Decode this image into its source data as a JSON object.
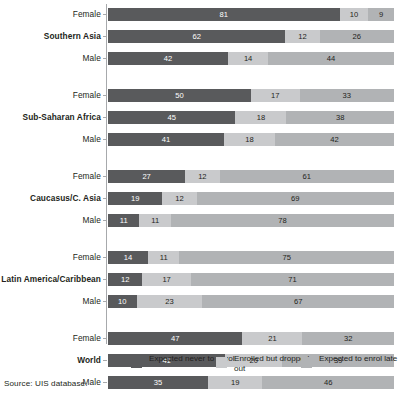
{
  "chart_data": {
    "type": "bar",
    "subtype": "stacked-horizontal-100pct",
    "title": "",
    "xlabel": "",
    "ylabel": "",
    "xlim": [
      0,
      100
    ],
    "grid": false,
    "legend_position": "bottom",
    "series": [
      {
        "name": "Expected never to enrol",
        "color": "#595a5c"
      },
      {
        "name": "Enrolled but dropped out",
        "color": "#c9cacc"
      },
      {
        "name": "Expected to enrol late",
        "color": "#b1b3b5"
      }
    ],
    "groups": [
      {
        "name": "Southern Asia",
        "rows": [
          {
            "label": "Female",
            "values": [
              81,
              10,
              9
            ]
          },
          {
            "label": "Southern Asia",
            "values": [
              62,
              12,
              26
            ],
            "is_region": true
          },
          {
            "label": "Male",
            "values": [
              42,
              14,
              44
            ]
          }
        ]
      },
      {
        "name": "Sub-Saharan Africa",
        "rows": [
          {
            "label": "Female",
            "values": [
              50,
              17,
              33
            ]
          },
          {
            "label": "Sub-Saharan Africa",
            "values": [
              45,
              18,
              38
            ],
            "is_region": true
          },
          {
            "label": "Male",
            "values": [
              41,
              18,
              42
            ]
          }
        ]
      },
      {
        "name": "Caucasus/C. Asia",
        "rows": [
          {
            "label": "Female",
            "values": [
              27,
              12,
              61
            ]
          },
          {
            "label": "Caucasus/C. Asia",
            "values": [
              19,
              12,
              69
            ],
            "is_region": true
          },
          {
            "label": "Male",
            "values": [
              11,
              11,
              78
            ]
          }
        ]
      },
      {
        "name": "Latin America/Caribbean",
        "rows": [
          {
            "label": "Female",
            "values": [
              14,
              11,
              75
            ]
          },
          {
            "label": "Latin America/Caribbean",
            "values": [
              12,
              17,
              71
            ],
            "is_region": true
          },
          {
            "label": "Male",
            "values": [
              10,
              23,
              67
            ]
          }
        ]
      },
      {
        "name": "World",
        "rows": [
          {
            "label": "Female",
            "values": [
              47,
              21,
              32
            ]
          },
          {
            "label": "World",
            "values": [
              41,
              20,
              39
            ],
            "is_region": true
          },
          {
            "label": "Male",
            "values": [
              35,
              19,
              46
            ]
          }
        ]
      }
    ]
  },
  "legend": {
    "items": [
      {
        "label": "Expected never to enrol",
        "swatch": "s0"
      },
      {
        "label": "Enrolled but dropped out",
        "swatch": "s1"
      },
      {
        "label": "Expected to enrol late",
        "swatch": "s2"
      }
    ]
  },
  "source": {
    "text": "Source: UIS database."
  }
}
